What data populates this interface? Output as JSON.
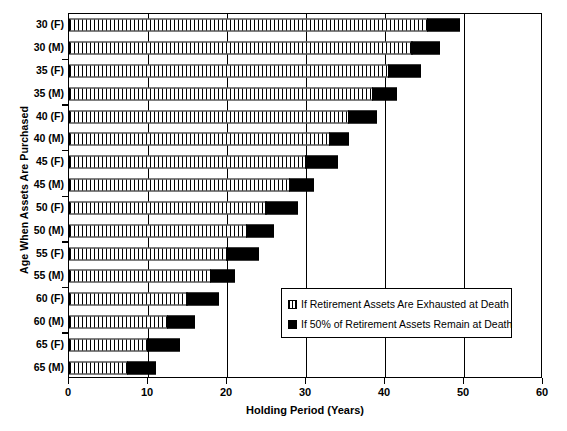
{
  "chart_data": {
    "type": "bar",
    "orientation": "horizontal",
    "stacked": true,
    "title": "",
    "xlabel": "Holding Period (Years)",
    "ylabel": "Age When Assets Are Purchased",
    "xlim": [
      0,
      60
    ],
    "xticks": [
      0,
      10,
      20,
      30,
      40,
      50,
      60
    ],
    "xticklabels": [
      "0",
      "10",
      "20",
      "30",
      "40",
      "50",
      "60"
    ],
    "grid": "vertical",
    "legend_position": "center-right-inside",
    "categories": [
      "30 (F)",
      "30 (M)",
      "35 (F)",
      "35 (M)",
      "40 (F)",
      "40 (M)",
      "45 (F)",
      "45 (M)",
      "50 (F)",
      "50 (M)",
      "55 (F)",
      "55 (M)",
      "60 (F)",
      "60 (M)",
      "65 (F)",
      "65 (M)"
    ],
    "series": [
      {
        "name": "If Retirement Assets Are Exhausted at Death",
        "pattern": "hatched",
        "color": "#ffffff",
        "values": [
          45.5,
          43.5,
          40.5,
          38.5,
          35.5,
          33.0,
          30.0,
          28.0,
          25.0,
          22.5,
          20.0,
          18.0,
          15.0,
          12.5,
          10.0,
          7.5
        ]
      },
      {
        "name": "If 50% of Retirement Assets Remain at Death",
        "pattern": "solid",
        "color": "#000000",
        "values": [
          4.0,
          3.5,
          4.0,
          3.0,
          3.5,
          2.5,
          4.0,
          3.0,
          4.0,
          3.5,
          4.0,
          3.0,
          4.0,
          3.5,
          4.0,
          3.5
        ]
      }
    ],
    "totals": [
      49.5,
      47.0,
      44.5,
      41.5,
      39.0,
      35.5,
      34.0,
      31.0,
      29.0,
      26.0,
      24.0,
      21.0,
      19.0,
      16.0,
      14.0,
      11.0
    ]
  },
  "legend": {
    "items": [
      {
        "swatch": "hatched-swatch",
        "label": "If Retirement Assets Are Exhausted at Death"
      },
      {
        "swatch": "solid-swatch",
        "label": "If 50% of Retirement Assets Remain at Death"
      }
    ]
  },
  "colors": {
    "axis": "#000000",
    "background": "#ffffff",
    "series_exhausted": "#ffffff",
    "series_remain": "#000000"
  }
}
